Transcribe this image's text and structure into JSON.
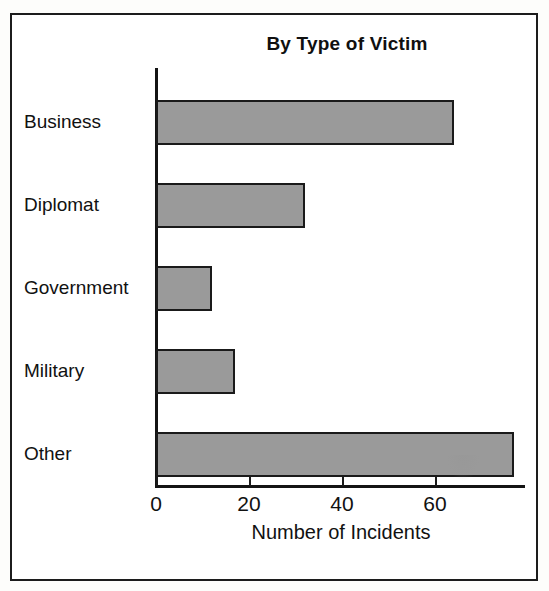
{
  "figure": {
    "frame_color": "#1c1c1c",
    "background": "#ffffff"
  },
  "chart_data": {
    "type": "bar",
    "orientation": "horizontal",
    "title": "By Type of Victim",
    "xlabel": "Number of Incidents",
    "ylabel": "",
    "categories": [
      "Business",
      "Diplomat",
      "Government",
      "Military",
      "Other"
    ],
    "values": [
      64,
      32,
      12,
      17,
      77
    ],
    "xlim": [
      0,
      79
    ],
    "xticks": [
      0,
      20,
      40,
      60
    ],
    "xtick_labels": [
      "0",
      "20",
      "40",
      "60"
    ],
    "grid": false,
    "legend": null,
    "bar_fill_color": "#9a9a9a",
    "bar_edge_color": "#1a1a1a",
    "axis_color": "#141414"
  }
}
